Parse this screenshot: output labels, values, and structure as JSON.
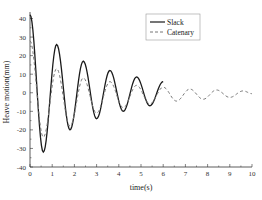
{
  "chart_data": {
    "type": "line",
    "title": "",
    "xlabel": "time(s)",
    "ylabel": "Heave motion(mm)",
    "xlim": [
      0,
      10
    ],
    "ylim": [
      -40,
      45
    ],
    "xticks": [
      0,
      1,
      2,
      3,
      4,
      5,
      6,
      7,
      8,
      9,
      10
    ],
    "yticks": [
      -40,
      -30,
      -20,
      -10,
      0,
      10,
      20,
      30,
      40
    ],
    "grid": false,
    "legend_position": "upper center",
    "series": [
      {
        "name": "Slack",
        "style": "solid",
        "color": "#1a1a1a",
        "x": [
          0,
          0.6,
          1.2,
          1.8,
          2.4,
          3.0,
          3.6,
          4.2,
          4.8,
          5.4,
          6.0
        ],
        "values": [
          42,
          -32,
          26,
          -20,
          17,
          -14,
          12,
          -10,
          8.5,
          -7,
          6
        ]
      },
      {
        "name": "Catenary",
        "style": "dashed",
        "color": "#777777",
        "x": [
          0,
          0.6,
          1.2,
          1.8,
          2.4,
          3.0,
          3.6,
          4.2,
          4.8,
          5.4,
          6.0,
          6.6,
          7.2,
          7.8,
          8.4,
          9.0,
          9.6,
          10.0
        ],
        "values": [
          28,
          -24,
          13,
          -18,
          8,
          -11,
          6,
          -8,
          4,
          -6,
          3,
          -4.5,
          2,
          -3.5,
          1.5,
          -2.5,
          1,
          -0.5
        ]
      }
    ]
  },
  "labels": {
    "xlabel": "time(s)",
    "ylabel": "Heave motion(mm)",
    "legend": [
      "Slack",
      "Catenary"
    ]
  }
}
